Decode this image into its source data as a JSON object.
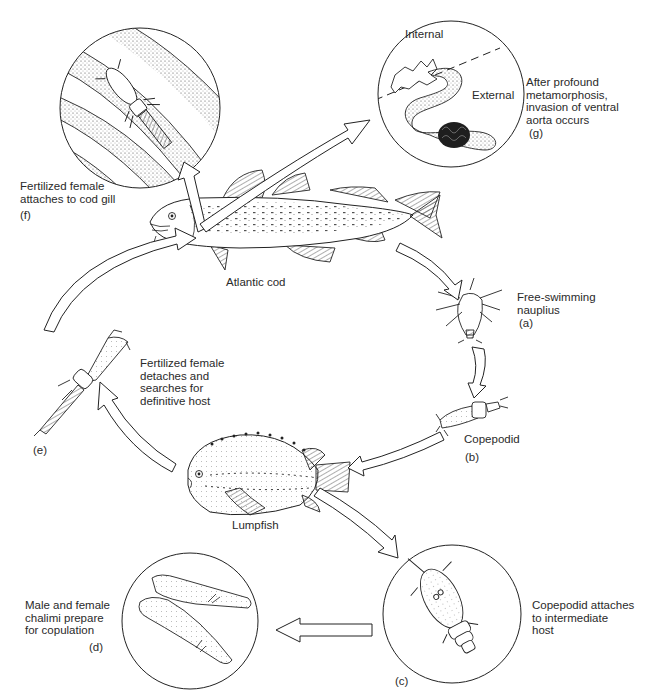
{
  "diagram": {
    "type": "life-cycle"
  },
  "hosts": {
    "definitive": {
      "label": "Atlantic cod"
    },
    "intermediate": {
      "label": "Lumpfish"
    }
  },
  "stages": [
    {
      "id": "a",
      "tag": "(a)",
      "text": "Free-swimming\nnauplius"
    },
    {
      "id": "b",
      "tag": "(b)",
      "text": "Copepodid"
    },
    {
      "id": "c",
      "tag": "(c)",
      "text": "Copepodid attaches\nto intermediate\nhost"
    },
    {
      "id": "d",
      "tag": "(d)",
      "text": "Male and female\nchalimi prepare\nfor copulation"
    },
    {
      "id": "e",
      "tag": "(e)",
      "text": "Fertilized female\ndetaches and\nsearches for\ndefinitive host"
    },
    {
      "id": "f",
      "tag": "(f)",
      "text": "Fertilized female\nattaches to cod gill"
    },
    {
      "id": "g",
      "tag": "(g)",
      "text": "After profound\nmetamorphosis,\ninvasion of ventral\naorta occurs"
    }
  ],
  "inset_g": {
    "internal_label": "Internal",
    "external_label": "External"
  },
  "colors": {
    "line": "#1e1e1e",
    "fill": "#ffffff",
    "stipple": "#555555"
  }
}
